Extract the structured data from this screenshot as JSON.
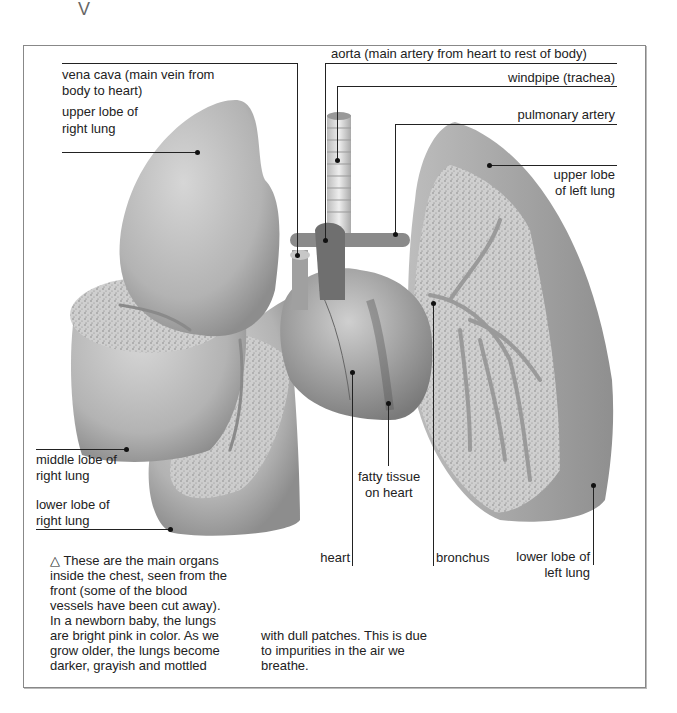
{
  "diagram": {
    "colors": {
      "organ_gray": "#b9b9b9",
      "tissue_speckle": "#9a9a9a",
      "line": "#222222",
      "frame": "#888888"
    }
  },
  "labels": {
    "aorta": "aorta (main artery from heart to rest of body)",
    "vena_cava_1": "vena cava (main vein from",
    "vena_cava_2": "body to heart)",
    "windpipe": "windpipe (trachea)",
    "pulmonary_artery": "pulmonary artery",
    "upper_right_1": "upper lobe of",
    "upper_right_2": "right lung",
    "upper_left_1": "upper lobe",
    "upper_left_2": "of left lung",
    "middle_right_1": "middle lobe of",
    "middle_right_2": "right lung",
    "lower_right_1": "lower lobe of",
    "lower_right_2": "right lung",
    "fatty_1": "fatty tissue",
    "fatty_2": "on heart",
    "heart": "heart",
    "bronchus": "bronchus",
    "lower_left_1": "lower lobe of",
    "lower_left_2": "left lung"
  },
  "caption": {
    "triangle": "△",
    "col1": [
      "These are the main organs",
      "inside the chest, seen from the",
      "front (some of the blood",
      "vessels have been cut away).",
      "In a newborn baby, the lungs",
      "are bright pink in color. As we",
      "grow older, the lungs become",
      "darker, grayish and mottled"
    ],
    "col2": [
      "with dull patches. This is due",
      "to impurities in the air we",
      "breathe."
    ]
  }
}
